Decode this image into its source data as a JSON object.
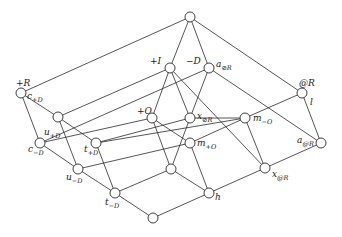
{
  "diagram": {
    "type": "lattice-hasse-diagram",
    "node_radius": 5,
    "nodes": [
      {
        "id": "top",
        "x": 190,
        "y": 17,
        "label": "",
        "sub": "",
        "lx": 0,
        "ly": 0
      },
      {
        "id": "plusI",
        "x": 170,
        "y": 68,
        "label": "+I",
        "sub": "",
        "lx": 150,
        "ly": 64
      },
      {
        "id": "minusD",
        "x": 209,
        "y": 68,
        "label": "−D",
        "sub": "",
        "lx": 186,
        "ly": 64
      },
      {
        "id": "plusR",
        "x": 21,
        "y": 93,
        "label": "+R",
        "sub": "",
        "lx": 16,
        "ly": 86
      },
      {
        "id": "atR",
        "x": 302,
        "y": 93,
        "label": "@R",
        "sub": "",
        "lx": 299,
        "ly": 86
      },
      {
        "id": "uplusD",
        "x": 58,
        "y": 117,
        "label": "u",
        "sub": "+D",
        "lx": 44,
        "ly": 135
      },
      {
        "id": "plusO",
        "x": 152,
        "y": 118,
        "label": "+O",
        "sub": "",
        "lx": 137,
        "ly": 114
      },
      {
        "id": "xOR",
        "x": 190,
        "y": 118,
        "label": "x",
        "sub": "⊘R",
        "lx": 197,
        "ly": 119
      },
      {
        "id": "mminusO",
        "x": 245,
        "y": 118,
        "label": "m",
        "sub": "−O",
        "lx": 253,
        "ly": 121
      },
      {
        "id": "cminusD",
        "x": 40,
        "y": 143,
        "label": "c",
        "sub": "−D",
        "lx": 28,
        "ly": 152
      },
      {
        "id": "tplusD",
        "x": 96,
        "y": 143,
        "label": "t",
        "sub": "+D",
        "lx": 84,
        "ly": 152
      },
      {
        "id": "mplusO",
        "x": 190,
        "y": 143,
        "label": "m",
        "sub": "+O",
        "lx": 197,
        "ly": 146
      },
      {
        "id": "aatR",
        "x": 321,
        "y": 143,
        "label": "a",
        "sub": "@R",
        "lx": 297,
        "ly": 143
      },
      {
        "id": "uminusD",
        "x": 78,
        "y": 169,
        "label": "u",
        "sub": "−D",
        "lx": 66,
        "ly": 180
      },
      {
        "id": "mid",
        "x": 171,
        "y": 169,
        "label": "",
        "sub": "",
        "lx": 0,
        "ly": 0
      },
      {
        "id": "xatR",
        "x": 265,
        "y": 168,
        "label": "x",
        "sub": "@R",
        "lx": 272,
        "ly": 177
      },
      {
        "id": "tminusD",
        "x": 115,
        "y": 193,
        "label": "t",
        "sub": "−D",
        "lx": 105,
        "ly": 205
      },
      {
        "id": "h",
        "x": 209,
        "y": 193,
        "label": "h",
        "sub": "",
        "lx": 215,
        "ly": 200
      },
      {
        "id": "bottom",
        "x": 153,
        "y": 218,
        "label": "",
        "sub": "",
        "lx": 0,
        "ly": 0
      }
    ],
    "extra_labels": [
      {
        "id": "c-plusD-label",
        "text": "c",
        "sub": "+D",
        "x": 27,
        "y": 99
      },
      {
        "id": "a-oR-label",
        "text": "a",
        "sub": "⊘R",
        "x": 216,
        "y": 67
      },
      {
        "id": "l-label",
        "text": "l",
        "sub": "",
        "x": 310,
        "y": 105
      }
    ],
    "edges": [
      [
        "top",
        "plusR"
      ],
      [
        "top",
        "plusI"
      ],
      [
        "top",
        "minusD"
      ],
      [
        "top",
        "atR"
      ],
      [
        "plusR",
        "uplusD"
      ],
      [
        "plusR",
        "cminusD"
      ],
      [
        "plusI",
        "uplusD"
      ],
      [
        "plusI",
        "plusO"
      ],
      [
        "plusI",
        "xOR"
      ],
      [
        "plusI",
        "xatR"
      ],
      [
        "minusD",
        "xOR"
      ],
      [
        "minusD",
        "aatR"
      ],
      [
        "minusD",
        "cminusD"
      ],
      [
        "atR",
        "mminusO"
      ],
      [
        "atR",
        "aatR"
      ],
      [
        "uplusD",
        "tplusD"
      ],
      [
        "uplusD",
        "uminusD"
      ],
      [
        "cminusD",
        "uminusD"
      ],
      [
        "cminusD",
        "plusO"
      ],
      [
        "plusO",
        "mid"
      ],
      [
        "plusO",
        "mplusO"
      ],
      [
        "xOR",
        "tplusD"
      ],
      [
        "xOR",
        "mid"
      ],
      [
        "xOR",
        "mminusO"
      ],
      [
        "mminusO",
        "mplusO"
      ],
      [
        "mminusO",
        "xatR"
      ],
      [
        "tplusD",
        "tminusD"
      ],
      [
        "tplusD",
        "mminusO"
      ],
      [
        "uminusD",
        "mplusO"
      ],
      [
        "uminusD",
        "tminusD"
      ],
      [
        "mplusO",
        "h"
      ],
      [
        "aatR",
        "xatR"
      ],
      [
        "xatR",
        "h"
      ],
      [
        "tminusD",
        "mid"
      ],
      [
        "tminusD",
        "bottom"
      ],
      [
        "mid",
        "h"
      ],
      [
        "bottom",
        "h"
      ]
    ]
  }
}
